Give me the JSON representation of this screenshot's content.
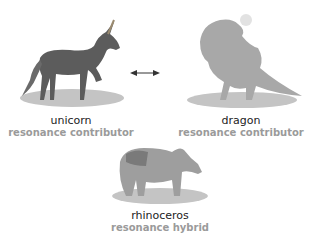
{
  "figures": [
    {
      "name": "unicorn",
      "role": "resonance contributor"
    },
    {
      "name": "dragon",
      "role": "resonance contributor"
    },
    {
      "name": "rhinoceros",
      "role": "resonance hybrid"
    }
  ],
  "arrow": {
    "type": "double-headed",
    "meaning": "resonance"
  },
  "colors": {
    "label": "#222222",
    "sublabel": "#9a9a9a",
    "animal": "#5e5e5e",
    "shadow": "#bdbdbd"
  }
}
